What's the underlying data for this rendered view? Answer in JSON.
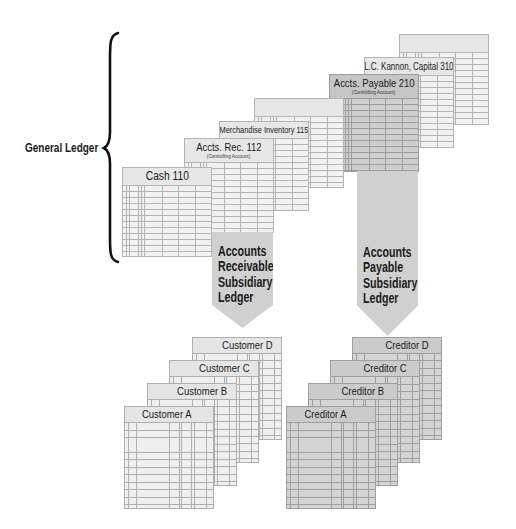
{
  "general_ledger": {
    "label": "General Ledger",
    "accounts": [
      {
        "id": "blank-back"
      },
      {
        "title": "L.C. Kannon, Capital 310"
      },
      {
        "title": "Accts. Payable 210",
        "subtitle": "(Controlling Account)"
      },
      {
        "id": "blank-middle"
      },
      {
        "title": "Merchandise Inventory 115"
      },
      {
        "title": "Accts. Rec. 112",
        "subtitle": "(Controlling Account)"
      },
      {
        "title": "Cash 110"
      }
    ]
  },
  "arrows": {
    "accounts_receivable": {
      "lines": [
        "Accounts",
        "Receivable",
        "Subsidiary",
        "Ledger"
      ]
    },
    "accounts_payable": {
      "lines": [
        "Accounts",
        "Payable",
        "Subsidiary",
        "Ledger"
      ]
    }
  },
  "subsidiary_ledgers": {
    "customers": [
      "Customer D",
      "Customer C",
      "Customer B",
      "Customer A"
    ],
    "creditors": [
      "Creditor D",
      "Creditor C",
      "Creditor B",
      "Creditor A"
    ]
  },
  "colors": {
    "gl-hdr": "#e7e7e7",
    "gl-body": "#f1f1f1",
    "gl-line": "#b4b4b4",
    "ap-hdr": "#c6c6c6",
    "ap-body": "#cfcfcf",
    "ap-line": "#9c9c9c",
    "arrow": "#d0d0d0",
    "cust-hdr": "#e5e5e5",
    "cust-body": "#efefef",
    "cust-line": "#afafaf",
    "cred-hdr": "#cbcbcb",
    "cred-body": "#d4d4d4",
    "cred-line": "#9e9e9e"
  }
}
